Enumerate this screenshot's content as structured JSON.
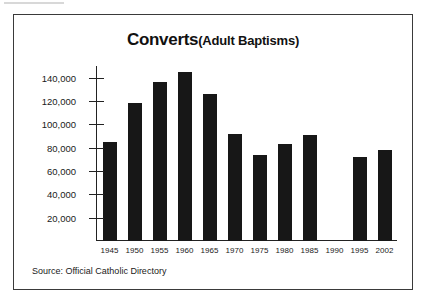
{
  "figure": {
    "source_note": "Source: Official Catholic Directory",
    "title_main": "Converts",
    "title_sub": "(Adult Baptisms)",
    "frame_color": "#3a3a3a",
    "bar_color": "#171717",
    "background": "#ffffff"
  },
  "chart_data": {
    "type": "bar",
    "xlabel": "",
    "ylabel": "",
    "ylim": [
      0,
      150000
    ],
    "grid": false,
    "legend": null,
    "yticks": [
      20000,
      40000,
      60000,
      80000,
      100000,
      120000,
      140000
    ],
    "ytick_labels": [
      "20,000",
      "40,000",
      "60,000",
      "80,000",
      "100,000",
      "120,000",
      "140,000"
    ],
    "categories": [
      "1945",
      "1950",
      "1955",
      "1960",
      "1965",
      "1970",
      "1975",
      "1980",
      "1985",
      "1990",
      "1995",
      "2002"
    ],
    "values": [
      85000,
      118000,
      136000,
      145000,
      126000,
      92000,
      74000,
      83000,
      91000,
      null,
      72000,
      78000
    ]
  }
}
